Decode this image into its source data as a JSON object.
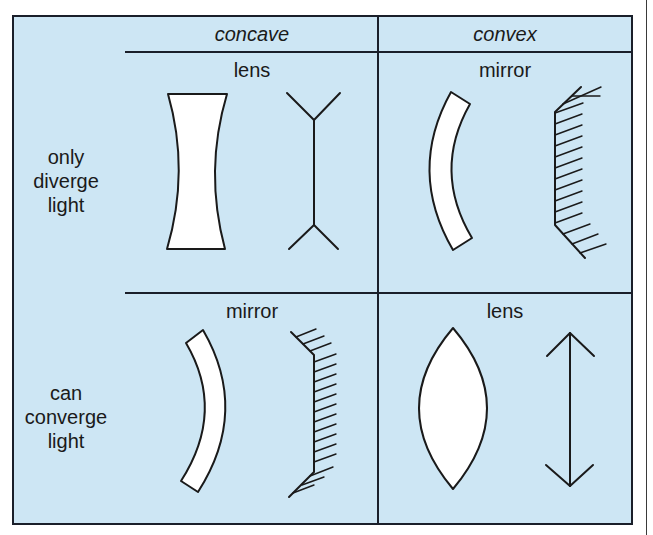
{
  "colors": {
    "panel_background": "#cde6f4",
    "line": "#1a1f2a",
    "shape_fill": "#ffffff"
  },
  "columns": [
    {
      "label": "concave"
    },
    {
      "label": "convex"
    }
  ],
  "rows": [
    {
      "label_lines": [
        "only",
        "diverge",
        "light"
      ]
    },
    {
      "label_lines": [
        "can",
        "converge",
        "light"
      ]
    }
  ],
  "cells": {
    "concave_diverge": {
      "label": "lens",
      "element": "concave-lens",
      "symbol": "concave-lens-symbol"
    },
    "convex_diverge": {
      "label": "mirror",
      "element": "convex-mirror",
      "symbol": "convex-mirror-symbol"
    },
    "concave_converge": {
      "label": "mirror",
      "element": "concave-mirror",
      "symbol": "concave-mirror-symbol"
    },
    "convex_converge": {
      "label": "lens",
      "element": "convex-lens",
      "symbol": "convex-lens-symbol"
    }
  }
}
